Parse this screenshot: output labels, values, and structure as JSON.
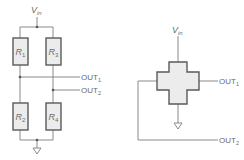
{
  "diagram": {
    "left": {
      "title": "Wheatstone bridge (discrete resistors)",
      "supply": {
        "label": "V",
        "sub": "in"
      },
      "resistors": [
        {
          "id": "R1",
          "label": "R",
          "sub": "1"
        },
        {
          "id": "R3",
          "label": "R",
          "sub": "3"
        },
        {
          "id": "R2",
          "label": "R",
          "sub": "2"
        },
        {
          "id": "R4",
          "label": "R",
          "sub": "4"
        }
      ],
      "outputs": [
        {
          "label": "OUT",
          "sub": "1"
        },
        {
          "label": "OUT",
          "sub": "2"
        }
      ],
      "ground": "ground-symbol"
    },
    "right": {
      "title": "Cross-shaped sensor element",
      "supply": {
        "label": "V",
        "sub": "in"
      },
      "outputs": [
        {
          "label": "OUT",
          "sub": "1"
        },
        {
          "label": "OUT",
          "sub": "2"
        }
      ],
      "ground": "ground-symbol"
    },
    "colors": {
      "line": "#8a8a8a",
      "box_fill": "#ececec",
      "box_stroke": "#5a5a5a",
      "text": "#6a6a6a"
    }
  }
}
